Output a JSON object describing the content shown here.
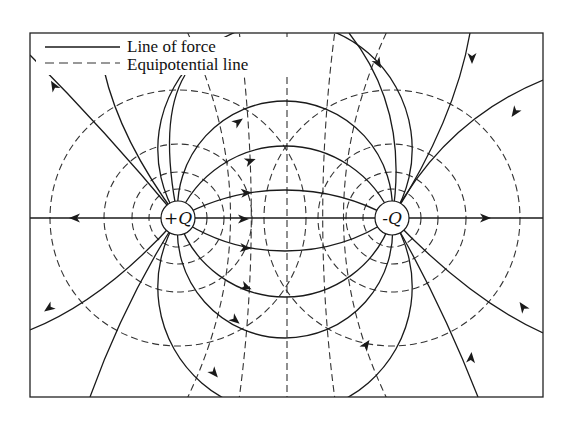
{
  "legend": {
    "items": [
      {
        "label": "Line of force",
        "style": "solid"
      },
      {
        "label": "Equipotential line",
        "style": "dashed"
      }
    ]
  },
  "charges": [
    {
      "label": "+Q",
      "cx": 178,
      "cy": 218,
      "r": 17
    },
    {
      "label": "-Q",
      "cx": 392,
      "cy": 218,
      "r": 17
    }
  ],
  "frame": {
    "x": 30,
    "y": 33,
    "width": 513,
    "height": 364
  },
  "colors": {
    "ink": "#1a1a1a",
    "background": "#ffffff"
  }
}
